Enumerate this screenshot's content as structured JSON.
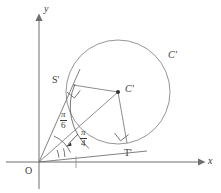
{
  "figure": {
    "type": "geometry-diagram",
    "axes": {
      "x_label": "x",
      "y_label": "y",
      "origin_label": "O"
    },
    "points": [
      {
        "id": "origin",
        "label": "O",
        "x": 39,
        "y": 162
      },
      {
        "id": "tangency-upper",
        "label": "S'",
        "x": 73,
        "y": 85
      },
      {
        "id": "tangency-lower",
        "label": "T'",
        "x": 127,
        "y": 143
      },
      {
        "id": "center",
        "label": "C'",
        "x": 118,
        "y": 92
      }
    ],
    "circle": {
      "label": "C'",
      "center_x": 118,
      "center_y": 92,
      "radius": 52
    },
    "angles": [
      {
        "id": "angle-upper",
        "numerator": "π",
        "denominator": "6",
        "value": "π/6"
      },
      {
        "id": "angle-lower",
        "numerator": "π",
        "denominator": "4",
        "value": "π/4"
      }
    ],
    "markers": {
      "right_angle_upper": "right-angle at S'",
      "right_angle_lower": "right-angle at T'"
    },
    "colors": {
      "stroke": "#6e6e6e",
      "circle_stroke": "#8a8a8a",
      "label_text": "#3a3a3a",
      "background": "#ffffff"
    }
  }
}
